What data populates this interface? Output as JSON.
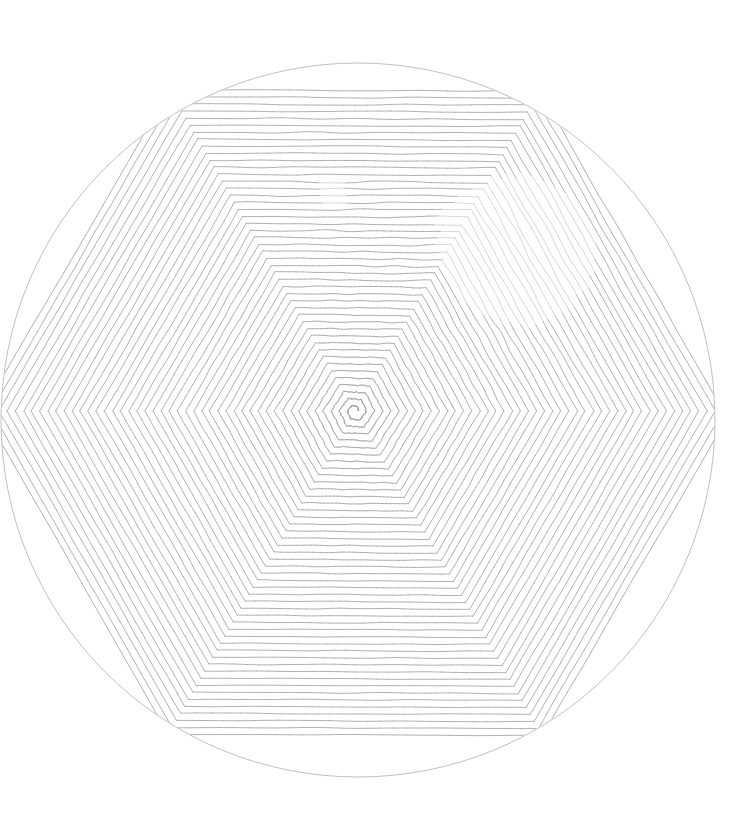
{
  "artwork": {
    "title": "Hexagonal Spiral in Circle",
    "medium": "generative-line-drawing",
    "canvas": {
      "width": 741,
      "height": 829,
      "background_color": "#ffffff"
    },
    "bounding_circle": {
      "label": "clipping-circle",
      "center_x": 358,
      "center_y": 420,
      "radius": 357,
      "stroke_color": "#b9b9b9",
      "stroke_width": 0.9,
      "fill": "none"
    },
    "spiral": {
      "label": "hexagonal-spiral",
      "shape": "hexagon",
      "orientation": "pointy-left-right",
      "vertex_angles_deg": [
        0,
        60,
        120,
        180,
        240,
        300
      ],
      "center_x": 355,
      "center_y": 411,
      "turns": 46,
      "ring_spacing_px": 8.1,
      "start_radius_px": 3.5,
      "max_radius_px": 430,
      "direction": "counter-clockwise",
      "stroke_color": "#a4a4a4",
      "stroke_width": 0.85,
      "segments_per_edge": 26
    },
    "texture": {
      "label": "hand-drawn-jitter",
      "base_jitter_px": 0.55,
      "noise_scale": 0.045,
      "hotspot": {
        "label": "upper-right-noise-field",
        "center_x": 520,
        "center_y": 250,
        "radius_px": 215,
        "jitter_multiplier": 4.2
      },
      "secondary_hotspot": {
        "label": "upper-center-noise-field",
        "center_x": 330,
        "center_y": 190,
        "radius_px": 175,
        "jitter_multiplier": 2.6
      }
    },
    "palette": {
      "background": "#ffffff",
      "line": "#a4a4a4",
      "circle": "#b9b9b9",
      "line_dark": "#8a8a8a",
      "line_light": "#c8c8c8"
    }
  }
}
